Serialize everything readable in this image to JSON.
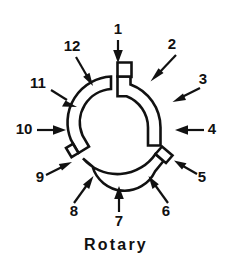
{
  "figure": {
    "title": "Rotary",
    "caption": "Rotary",
    "background_color": "#ffffff",
    "line_color": "#111111",
    "fill_color": "#ffffff",
    "part_name": "rotary-ring",
    "callout_count": 12
  },
  "callouts": [
    {
      "id": 1,
      "label": "1",
      "label_x": 118,
      "label_y": 30,
      "arrow_name": "callout-arrow-1",
      "direction": "down"
    },
    {
      "id": 2,
      "label": "2",
      "label_x": 172,
      "label_y": 45,
      "arrow_name": "callout-arrow-2",
      "direction": "down-left"
    },
    {
      "id": 3,
      "label": "3",
      "label_x": 203,
      "label_y": 80,
      "arrow_name": "callout-arrow-3",
      "direction": "down-left"
    },
    {
      "id": 4,
      "label": "4",
      "label_x": 212,
      "label_y": 130,
      "arrow_name": "callout-arrow-4",
      "direction": "left"
    },
    {
      "id": 5,
      "label": "5",
      "label_x": 202,
      "label_y": 178,
      "arrow_name": "callout-arrow-5",
      "direction": "up-left"
    },
    {
      "id": 6,
      "label": "6",
      "label_x": 166,
      "label_y": 212,
      "arrow_name": "callout-arrow-6",
      "direction": "up-left"
    },
    {
      "id": 7,
      "label": "7",
      "label_x": 119,
      "label_y": 222,
      "arrow_name": "callout-arrow-7",
      "direction": "up"
    },
    {
      "id": 8,
      "label": "8",
      "label_x": 74,
      "label_y": 212,
      "arrow_name": "callout-arrow-8",
      "direction": "up-right"
    },
    {
      "id": 9,
      "label": "9",
      "label_x": 40,
      "label_y": 178,
      "arrow_name": "callout-arrow-9",
      "direction": "up-right"
    },
    {
      "id": 10,
      "label": "10",
      "label_x": 24,
      "label_y": 130,
      "arrow_name": "callout-arrow-10",
      "direction": "right"
    },
    {
      "id": 11,
      "label": "11",
      "label_x": 38,
      "label_y": 84,
      "arrow_name": "callout-arrow-11",
      "direction": "down-right"
    },
    {
      "id": 12,
      "label": "12",
      "label_x": 72,
      "label_y": 47,
      "arrow_name": "callout-arrow-12",
      "direction": "down-right"
    }
  ]
}
